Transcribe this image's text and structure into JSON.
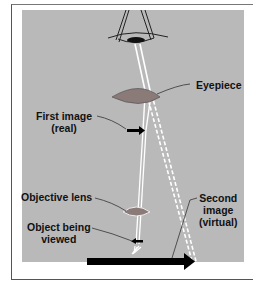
{
  "labels": {
    "eyepiece": "Eyepiece",
    "first_image_line1": "First image",
    "first_image_line2": "(real)",
    "objective_lens": "Objective lens",
    "object_line1": "Object being",
    "object_line2": "viewed",
    "second_image_line1": "Second",
    "second_image_line2": "image",
    "second_image_line3": "(virtual)"
  },
  "colors": {
    "panel": "#b9b9b9",
    "lens": "#8a7a78",
    "ray": "#ffffff",
    "arrow": "#000000",
    "frame": "#555555"
  },
  "icons": [
    "eye-icon",
    "eyepiece-lens-icon",
    "objective-lens-icon",
    "first-image-arrow-icon",
    "object-arrow-icon",
    "second-image-arrow-icon"
  ]
}
